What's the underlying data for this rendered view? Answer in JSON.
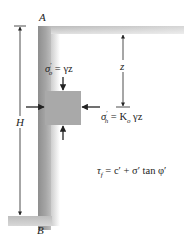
{
  "figure": {
    "points": {
      "top": "A",
      "bottom": "B"
    },
    "dimensions": {
      "height_label": "H",
      "depth_label": "z"
    },
    "vertical_stress": {
      "symbol": "σ",
      "prime": "′",
      "subscript": "o",
      "rhs": " = γz"
    },
    "horizontal_stress": {
      "symbol": "σ",
      "prime": "′",
      "subscript": "h",
      "rhs_pre": " = K",
      "rhs_sub": "o",
      "rhs_post": " γz"
    },
    "shear_strength": {
      "lhs": "τ",
      "lhs_sub": "f",
      "rhs": " = c′ + σ′ tan φ′"
    },
    "colors": {
      "wall_dark": "#9a9a9a",
      "wall_light": "#e6e6e6",
      "element": "#a8a8a8",
      "line": "#222222"
    }
  }
}
